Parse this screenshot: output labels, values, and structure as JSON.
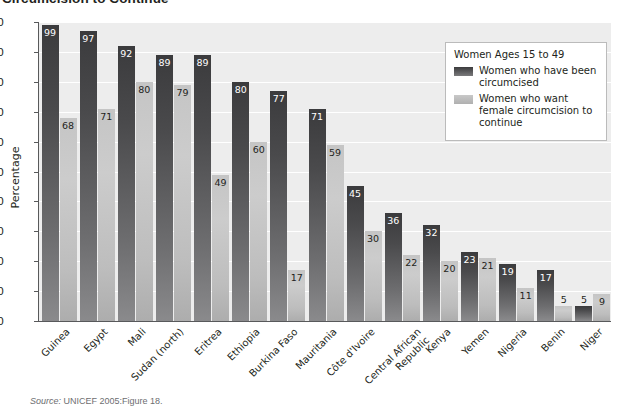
{
  "chart_data": {
    "type": "bar",
    "title": "Circumcision to Continue",
    "xlabel": "",
    "ylabel": "Percentage",
    "ylim": [
      0,
      100
    ],
    "ytick_step": 10,
    "yticks": [
      0,
      10,
      20,
      30,
      40,
      50,
      60,
      70,
      80,
      90,
      100
    ],
    "grid": true,
    "legend_position": "upper right",
    "legend_title": "Women Ages 15 to 49",
    "categories": [
      "Guinea",
      "Egypt",
      "Mali",
      "Sudan (north)",
      "Eritrea",
      "Ethiopia",
      "Burkina Faso",
      "Mauritania",
      "Côte d'Ivoire",
      "Central African Republic",
      "Kenya",
      "Yemen",
      "Nigeria",
      "Benin",
      "Niger"
    ],
    "series": [
      {
        "name": "Women who have been circumcised",
        "color": "#4a4a4c",
        "values": [
          99,
          97,
          92,
          89,
          89,
          80,
          77,
          71,
          45,
          36,
          32,
          23,
          19,
          17,
          5
        ]
      },
      {
        "name": "Women who want female circumcision to continue",
        "color": "#c3c3c3",
        "values": [
          68,
          71,
          80,
          79,
          49,
          60,
          17,
          59,
          30,
          22,
          20,
          21,
          11,
          5,
          9
        ]
      }
    ],
    "source": "Source: UNICEF 2005:Figure 18.",
    "source_prefix": "Source:",
    "source_rest": " UNICEF 2005:Figure 18."
  },
  "legend": {
    "title": "Women Ages 15 to 49",
    "entries": [
      {
        "label": "Women who have been circumcised",
        "swatch": "dark"
      },
      {
        "label": "Women who want female circumcision to continue",
        "swatch": "light"
      }
    ]
  },
  "axis": {
    "y_label": "Percentage"
  },
  "colors": {
    "plot_background": "#ededed",
    "gridline": "#ffffff",
    "axis_line": "#58595b",
    "series_dark": "#4a4a4c",
    "series_light": "#c3c3c3",
    "text": "#231f20",
    "source_text": "#6d6e71"
  }
}
